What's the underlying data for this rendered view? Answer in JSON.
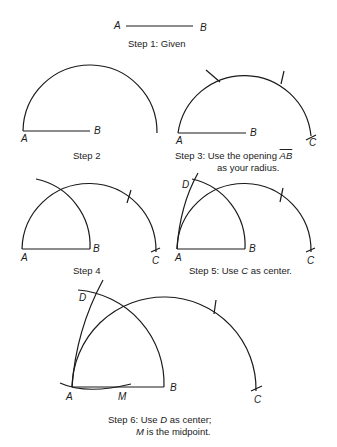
{
  "steps": [
    {
      "id": 1,
      "caption": "Step 1: Given",
      "labels": {
        "A": "A",
        "B": "B"
      }
    },
    {
      "id": 2,
      "caption": "Step 2",
      "labels": {
        "A": "A",
        "B": "B"
      }
    },
    {
      "id": 3,
      "caption_prefix": "Step 3:  Use the opening ",
      "caption_segment": "AB",
      "caption_line2": "as your radius.",
      "labels": {
        "A": "A",
        "B": "B",
        "C": "C"
      }
    },
    {
      "id": 4,
      "caption": "Step 4",
      "labels": {
        "A": "A",
        "B": "B",
        "C": "C"
      }
    },
    {
      "id": 5,
      "caption_prefix": "Step 5: Use ",
      "caption_var": "C",
      "caption_suffix": " as center.",
      "labels": {
        "A": "A",
        "B": "B",
        "C": "C",
        "D": "D"
      }
    },
    {
      "id": 6,
      "caption_prefix": "Step 6: Use ",
      "caption_var": "D",
      "caption_suffix": " as center;",
      "caption_line2_var": "M",
      "caption_line2_suffix": " is the midpoint.",
      "labels": {
        "A": "A",
        "B": "B",
        "C": "C",
        "D": "D",
        "M": "M"
      }
    }
  ],
  "colors": {
    "ink": "#1a1a1a",
    "background": "#ffffff"
  }
}
